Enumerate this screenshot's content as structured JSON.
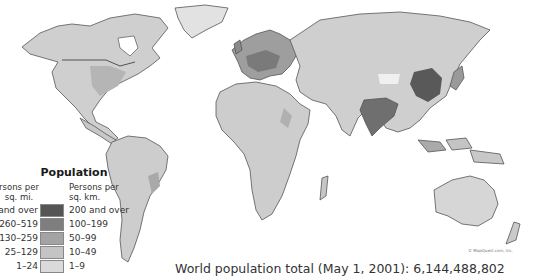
{
  "map": {
    "type": "choropleth",
    "subject": "World population density",
    "colors": {
      "background": "#ffffff",
      "border": "#444444",
      "class_5": "#555555",
      "class_4": "#7e7e7e",
      "class_3": "#a3a3a3",
      "class_2": "#c4c4c4",
      "class_1": "#dadada"
    }
  },
  "legend": {
    "title": "Population",
    "col_left_header": "Persons per sq. mi.",
    "col_left_header_line1": "rsons per",
    "col_left_header_line2": "sq. mi.",
    "col_right_header_line1": "Persons per",
    "col_right_header_line2": "sq. km.",
    "rows": [
      {
        "mi": "and over",
        "mi_full": "520 and over",
        "km": "200 and over",
        "color": "#555555"
      },
      {
        "mi": "260–519",
        "km": "100–199",
        "color": "#7e7e7e"
      },
      {
        "mi": "130–259",
        "km": "50–99",
        "color": "#a3a3a3"
      },
      {
        "mi": "25–129",
        "km": "10–49",
        "color": "#c4c4c4"
      },
      {
        "mi": "1–24",
        "km": "1–9",
        "color": "#dadada"
      }
    ]
  },
  "caption": "World population total (May 1, 2001): 6,144,488,802",
  "credit": "© MapQuest.com, Inc."
}
